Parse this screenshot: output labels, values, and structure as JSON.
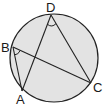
{
  "diagram": {
    "type": "inscribed-quadrilateral-circle",
    "circle": {
      "cx": 54,
      "cy": 58,
      "r": 44,
      "fill": "#e3e3e3",
      "stroke": "#222222"
    },
    "points": {
      "A": {
        "label": "A",
        "x": 22,
        "y": 91
      },
      "B": {
        "label": "B",
        "x": 13,
        "y": 47
      },
      "C": {
        "label": "C",
        "x": 91,
        "y": 83
      },
      "D": {
        "label": "D",
        "x": 51,
        "y": 15
      }
    },
    "segments": [
      "DA",
      "DC",
      "BC",
      "BA"
    ],
    "marked_angles": [
      "ADC",
      "ABC"
    ]
  }
}
